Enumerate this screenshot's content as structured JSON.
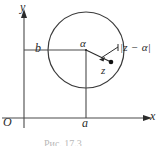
{
  "figure": {
    "kind": "complex-plane-diagram",
    "caption": "Рис. 17.3",
    "axes": {
      "x_label": "x",
      "y_label": "y",
      "origin_label": "O"
    },
    "ticks": {
      "x_value_label": "a",
      "y_value_label": "b"
    },
    "points": {
      "center_label": "α",
      "point_label": "z"
    },
    "annotations": {
      "distance_label": "|z − α|"
    },
    "colors": {
      "ink": "#2b2b2b",
      "line": "#4a4a4a",
      "background": "#ffffff"
    },
    "geometry": {
      "circle_center_x": 86,
      "circle_center_y": 50,
      "circle_radius": 38,
      "x_axis_y": 118,
      "y_axis_x": 24,
      "point_z_x": 110,
      "point_z_y": 63
    }
  }
}
